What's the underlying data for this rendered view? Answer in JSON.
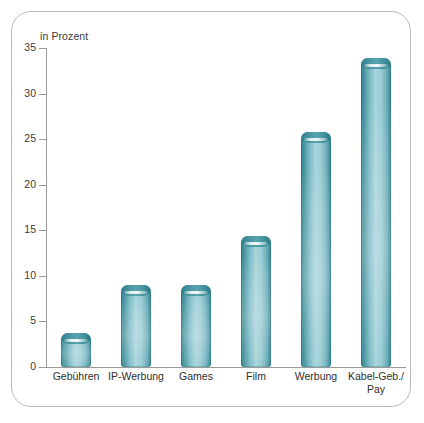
{
  "chart_data": {
    "type": "bar",
    "title": "",
    "subtitle": "in Prozent",
    "xlabel": "",
    "ylabel": "in Prozent",
    "categories": [
      "Gebühren",
      "IP-Werbung",
      "Games",
      "Film",
      "Werbung",
      "Kabel-Geb./\nPay"
    ],
    "values": [
      3.7,
      9.0,
      9.0,
      14.4,
      25.8,
      33.9
    ],
    "yticks": [
      "0",
      "5",
      "10",
      "15",
      "20",
      "25",
      "30",
      "35"
    ],
    "ytick_values": [
      0,
      5,
      10,
      15,
      20,
      25,
      30,
      35
    ],
    "ylim": [
      0,
      35
    ],
    "grid": false,
    "legend": null,
    "bar_color": "#6fb0bb",
    "bar_edge_color": "#2e7f8c",
    "axis_color": "#9a9a9a",
    "text_color": "#3c3c3c",
    "border_color": "#b9b9b9"
  },
  "card": {
    "subtitle": "in Prozent"
  }
}
